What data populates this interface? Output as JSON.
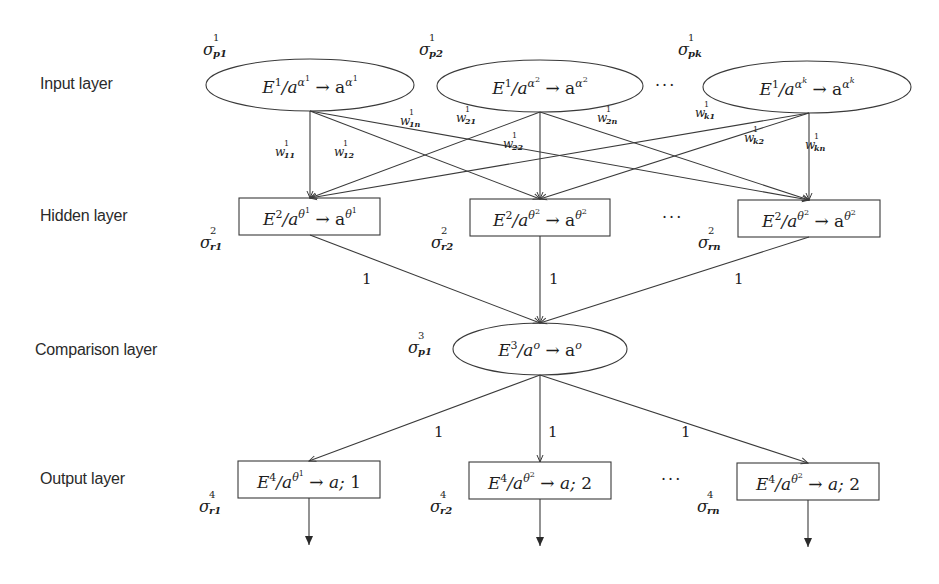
{
  "diagram": {
    "type": "layered-network",
    "stroke_color": "#3a3a3a",
    "layers": [
      {
        "label": "Input layer",
        "shape": "ellipse"
      },
      {
        "label": "Hidden layer",
        "shape": "box"
      },
      {
        "label": "Comparison layer",
        "shape": "ellipse"
      },
      {
        "label": "Output layer",
        "shape": "box"
      }
    ],
    "input_nodes": [
      {
        "sigma": "σ",
        "sigma_sup": "1",
        "sigma_sub": "p1",
        "E": "E",
        "E_sup": "1",
        "mid": "/a",
        "mid_sup": "α",
        "mid_sup_sub": "1",
        "arrow": " → a",
        "tail_sup": "α",
        "tail_sup_sub": "1"
      },
      {
        "sigma": "σ",
        "sigma_sup": "1",
        "sigma_sub": "p2",
        "E": "E",
        "E_sup": "1",
        "mid": "/a",
        "mid_sup": "α",
        "mid_sup_sub": "2",
        "arrow": " → a",
        "tail_sup": "α",
        "tail_sup_sub": "2"
      },
      {
        "sigma": "σ",
        "sigma_sup": "1",
        "sigma_sub": "pk",
        "E": "E",
        "E_sup": "1",
        "mid": "/a",
        "mid_sup": "α",
        "mid_sup_sub": "k",
        "arrow": " → a",
        "tail_sup": "α",
        "tail_sup_sub": "k"
      }
    ],
    "hidden_nodes": [
      {
        "sigma": "σ",
        "sigma_sup": "2",
        "sigma_sub": "r1",
        "E": "E",
        "E_sup": "2",
        "mid": "/a",
        "mid_sup": "θ",
        "mid_sup_sub": "1",
        "arrow": " → a",
        "tail_sup": "θ",
        "tail_sup_sub": "1"
      },
      {
        "sigma": "σ",
        "sigma_sup": "2",
        "sigma_sub": "r2",
        "E": "E",
        "E_sup": "2",
        "mid": "/a",
        "mid_sup": "θ",
        "mid_sup_sub": "2",
        "arrow": " → a",
        "tail_sup": "θ",
        "tail_sup_sub": "2"
      },
      {
        "sigma": "σ",
        "sigma_sup": "2",
        "sigma_sub": "rn",
        "E": "E",
        "E_sup": "2",
        "mid": "/a",
        "mid_sup": "θ",
        "mid_sup_sub": "2",
        "arrow": " → a",
        "tail_sup": "θ",
        "tail_sup_sub": "2"
      }
    ],
    "comparison_node": {
      "sigma": "σ",
      "sigma_sup": "3",
      "sigma_sub": "p1",
      "E": "E",
      "E_sup": "3",
      "mid": "/a",
      "mid_sup": "o",
      "arrow": " → a",
      "tail_sup": "o"
    },
    "output_nodes": [
      {
        "sigma": "σ",
        "sigma_sup": "4",
        "sigma_sub": "r1",
        "E": "E",
        "E_sup": "4",
        "mid": "/a",
        "mid_sup": "θ",
        "mid_sup_sub": "1",
        "tail": " → a; ",
        "tail_num": "1"
      },
      {
        "sigma": "σ",
        "sigma_sup": "4",
        "sigma_sub": "r2",
        "E": "E",
        "E_sup": "4",
        "mid": "/a",
        "mid_sup": "θ",
        "mid_sup_sub": "2",
        "tail": " → a; ",
        "tail_num": "2"
      },
      {
        "sigma": "σ",
        "sigma_sup": "4",
        "sigma_sub": "rn",
        "E": "E",
        "E_sup": "4",
        "mid": "/a",
        "mid_sup": "θ",
        "mid_sup_sub": "2",
        "tail": " → a; ",
        "tail_num": "2"
      }
    ],
    "weights": [
      {
        "w": "w",
        "sup": "1",
        "sub": "11"
      },
      {
        "w": "w",
        "sup": "1",
        "sub": "12"
      },
      {
        "w": "w",
        "sup": "1",
        "sub": "1n"
      },
      {
        "w": "w",
        "sup": "1",
        "sub": "21"
      },
      {
        "w": "w",
        "sup": "1",
        "sub": "22"
      },
      {
        "w": "w",
        "sup": "1",
        "sub": "2n"
      },
      {
        "w": "w",
        "sup": "1",
        "sub": "k1"
      },
      {
        "w": "w",
        "sup": "1",
        "sub": "k2"
      },
      {
        "w": "w",
        "sup": "1",
        "sub": "kn"
      }
    ],
    "edge_weights": {
      "hidden_to_comparison": [
        "1",
        "1",
        "1"
      ],
      "comparison_to_output": [
        "1",
        "1",
        "1"
      ]
    },
    "ellipsis": "···"
  }
}
